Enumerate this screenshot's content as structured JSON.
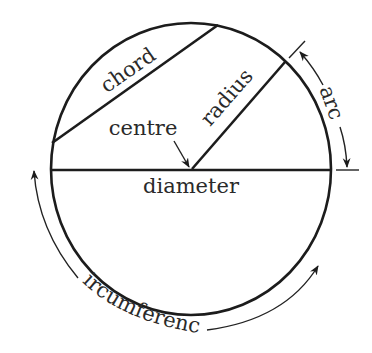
{
  "diagram": {
    "labels": {
      "chord": "chord",
      "radius": "radius",
      "centre": "centre",
      "diameter": "diameter",
      "arc": "arc",
      "circumference": "circumference"
    },
    "colors": {
      "line": "#1c1c1c",
      "text": "#2a2a2a",
      "background": "#ffffff"
    }
  }
}
